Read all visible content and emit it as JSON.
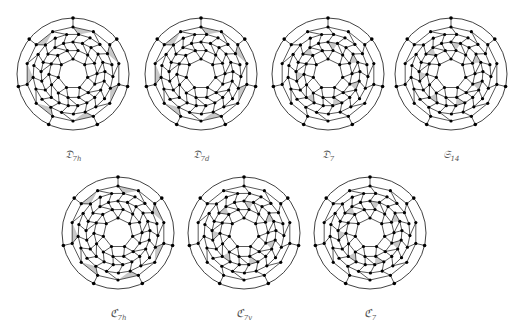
{
  "figures": [
    {
      "id": "D7h",
      "label": "𝔇",
      "sub": "7h",
      "cx": 73,
      "cy": 74,
      "shade": "outer"
    },
    {
      "id": "D7d",
      "label": "𝔇",
      "sub": "7d",
      "cx": 201,
      "cy": 74,
      "shade": "outer"
    },
    {
      "id": "D7",
      "label": "𝔇",
      "sub": "7",
      "cx": 328,
      "cy": 74,
      "shade": "mid"
    },
    {
      "id": "S14",
      "label": "𝔖",
      "sub": "14",
      "cx": 451,
      "cy": 74,
      "shade": "mid"
    },
    {
      "id": "C7h",
      "label": "ℭ",
      "sub": "7h",
      "cx": 118,
      "cy": 233,
      "shade": "outer"
    },
    {
      "id": "C7v",
      "label": "ℭ",
      "sub": "7v",
      "cx": 244,
      "cy": 233,
      "shade": "mid"
    },
    {
      "id": "C7",
      "label": "ℭ",
      "sub": "7",
      "cx": 370,
      "cy": 233,
      "shade": "mid"
    }
  ],
  "colors": {
    "stroke": "#111111",
    "fill_shade": "#c8c8c8",
    "vertex": "#000000"
  }
}
